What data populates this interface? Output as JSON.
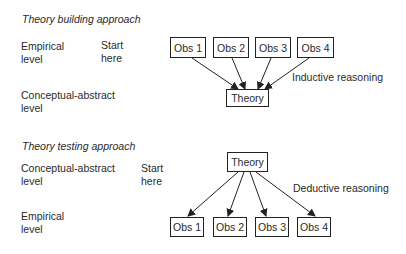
{
  "building": {
    "title": "Theory building approach",
    "level_top": "Empirical\nlevel",
    "level_top_l1": "Empirical",
    "level_top_l2": "level",
    "level_bottom_l1": "Conceptual-abstract",
    "level_bottom_l2": "level",
    "start_l1": "Start",
    "start_l2": "here",
    "observations": [
      "Obs 1",
      "Obs 2",
      "Obs 3",
      "Obs 4"
    ],
    "theory": "Theory",
    "reasoning": "Inductive reasoning"
  },
  "testing": {
    "title": "Theory testing approach",
    "level_top_l1": "Conceptual-abstract",
    "level_top_l2": "level",
    "level_bottom_l1": "Empirical",
    "level_bottom_l2": "level",
    "start_l1": "Start",
    "start_l2": "here",
    "theory": "Theory",
    "observations": [
      "Obs 1",
      "Obs 2",
      "Obs 3",
      "Obs 4"
    ],
    "reasoning": "Deductive reasoning"
  }
}
